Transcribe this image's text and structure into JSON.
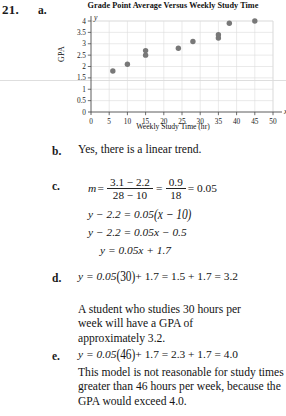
{
  "problem": {
    "number": "21.",
    "parts": {
      "a": "a.",
      "b": "b.",
      "c": "c.",
      "d": "d.",
      "e": "e."
    }
  },
  "chart_data": {
    "type": "scatter",
    "title": "Grade Point Average Versus Weekly Study Time",
    "xlabel": "Weekly Study Time (hr)",
    "ylabel": "GPA",
    "x_axis_symbol": "x",
    "y_axis_symbol": "y",
    "xlim": [
      0,
      50
    ],
    "ylim": [
      0,
      4
    ],
    "xticks": [
      0,
      5,
      10,
      15,
      20,
      25,
      30,
      35,
      40,
      45,
      50
    ],
    "xtick_labels": [
      "0",
      "5",
      "10",
      "15",
      "20",
      "25",
      "30",
      "35",
      "40",
      "45",
      "50"
    ],
    "yticks": [
      0,
      0.5,
      1,
      1.5,
      2,
      2.5,
      3,
      3.5,
      4
    ],
    "ytick_labels": [
      "0",
      "0.5",
      "1",
      "1.5",
      "2",
      "2.5",
      "3",
      "3.5",
      "4"
    ],
    "grid": true,
    "legend": "none",
    "marker_color": "#787878",
    "grid_color": "#dcdcdc",
    "axis_color": "#4a4a4a",
    "points": [
      {
        "x": 6,
        "y": 1.8
      },
      {
        "x": 10,
        "y": 2.1
      },
      {
        "x": 15,
        "y": 2.5
      },
      {
        "x": 15,
        "y": 2.7
      },
      {
        "x": 24,
        "y": 2.8
      },
      {
        "x": 28,
        "y": 3.1
      },
      {
        "x": 35,
        "y": 3.25
      },
      {
        "x": 35,
        "y": 3.4
      },
      {
        "x": 38,
        "y": 3.9
      },
      {
        "x": 45,
        "y": 4.0
      }
    ]
  },
  "answers": {
    "b_text": "Yes, there is a linear trend.",
    "c": {
      "slope_lhs": "m",
      "slope_eq": "=",
      "frac1_num": "3.1 − 2.2",
      "frac1_den": "28 − 10",
      "frac2_num": "0.9",
      "frac2_den": "18",
      "slope_value": "= 0.05",
      "line1": "y − 2.2 = 0.05",
      "line1_paren": "(x − 10)",
      "line2": "y − 2.2 = 0.05x − 0.5",
      "line3": "y = 0.05x + 1.7"
    },
    "d": {
      "equation_lead": "y = 0.05",
      "equation_paren": "(30)",
      "equation_tail": "+ 1.7 = 1.5 + 1.7 = 3.2",
      "text": "A student who studies 30 hours per week will have a GPA of approximately 3.2."
    },
    "e": {
      "equation_lead": "y = 0.05",
      "equation_paren": "(46)",
      "equation_tail": "+ 1.7 = 2.3 + 1.7 = 4.0",
      "text": "This model is not reasonable for study times greater than 46 hours per week, because the GPA would exceed 4.0."
    }
  }
}
